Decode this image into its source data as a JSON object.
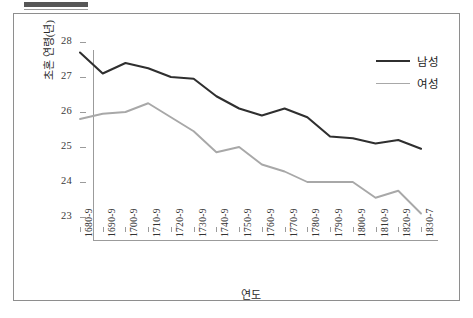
{
  "chart_data": {
    "type": "line",
    "title": "",
    "subtitle": "",
    "xlabel": "연도",
    "ylabel": "초혼 연령(년)",
    "categories": [
      "1680-9",
      "1690-9",
      "1700-9",
      "1710-9",
      "1720-9",
      "1730-9",
      "1740-9",
      "1750-9",
      "1760-9",
      "1770-9",
      "1780-9",
      "1790-9",
      "1800-9",
      "1810-9",
      "1820-9",
      "1830-7"
    ],
    "ylim": [
      22.6,
      28.35
    ],
    "yticks": [
      23,
      24,
      25,
      26,
      27,
      28
    ],
    "ytick_labels": [
      "23",
      "24",
      "25",
      "26",
      "27",
      "28"
    ],
    "grid": false,
    "legend_position": "top-right",
    "series": [
      {
        "name": "남성",
        "color": "#2f2f2f",
        "width": 2.1,
        "values": [
          27.7,
          27.1,
          27.4,
          27.25,
          27.0,
          26.95,
          26.45,
          26.1,
          25.9,
          26.1,
          25.85,
          25.3,
          25.25,
          25.1,
          25.2,
          24.95
        ]
      },
      {
        "name": "여성",
        "color": "#a8a8a8",
        "width": 1.9,
        "values": [
          25.8,
          25.95,
          26.0,
          26.25,
          25.85,
          25.45,
          24.85,
          25.0,
          24.5,
          24.3,
          24.0,
          24.0,
          24.0,
          23.55,
          23.75,
          23.1
        ]
      }
    ]
  },
  "legend": {
    "items": [
      {
        "label": "남성",
        "color": "#2f2f2f",
        "width": "2.1px"
      },
      {
        "label": "여성",
        "color": "#a8a8a8",
        "width": "1.9px"
      }
    ]
  },
  "axes": {
    "y_title": "초혼 연령(년)",
    "x_title": "연도"
  }
}
